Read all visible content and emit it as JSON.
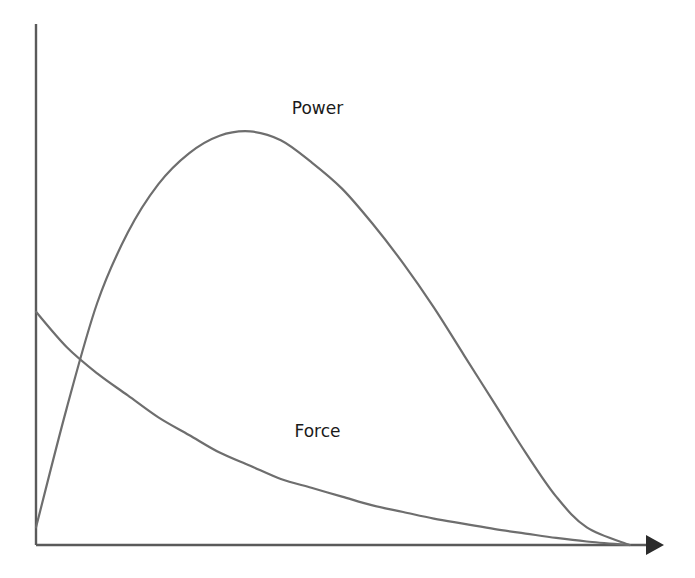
{
  "chart_data": {
    "type": "line",
    "title": "",
    "xlabel": "",
    "ylabel": "",
    "xlim": [
      0,
      1
    ],
    "ylim": [
      0,
      1
    ],
    "grid": false,
    "legend": "none",
    "x_axis_arrow": true,
    "series": [
      {
        "name": "Power",
        "label": "Power",
        "color": "#6e6e6e",
        "points": [
          [
            0.0,
            0.04
          ],
          [
            0.05,
            0.31
          ],
          [
            0.1,
            0.55
          ],
          [
            0.15,
            0.71
          ],
          [
            0.2,
            0.82
          ],
          [
            0.25,
            0.89
          ],
          [
            0.3,
            0.93
          ],
          [
            0.35,
            0.94
          ],
          [
            0.4,
            0.92
          ],
          [
            0.45,
            0.87
          ],
          [
            0.5,
            0.81
          ],
          [
            0.55,
            0.73
          ],
          [
            0.6,
            0.64
          ],
          [
            0.65,
            0.54
          ],
          [
            0.7,
            0.43
          ],
          [
            0.75,
            0.32
          ],
          [
            0.8,
            0.21
          ],
          [
            0.85,
            0.11
          ],
          [
            0.9,
            0.04
          ],
          [
            0.97,
            0.0
          ]
        ]
      },
      {
        "name": "Force",
        "label": "Force",
        "color": "#6e6e6e",
        "points": [
          [
            0.0,
            0.53
          ],
          [
            0.05,
            0.45
          ],
          [
            0.1,
            0.39
          ],
          [
            0.15,
            0.34
          ],
          [
            0.2,
            0.29
          ],
          [
            0.25,
            0.25
          ],
          [
            0.3,
            0.21
          ],
          [
            0.35,
            0.18
          ],
          [
            0.4,
            0.15
          ],
          [
            0.45,
            0.13
          ],
          [
            0.5,
            0.11
          ],
          [
            0.55,
            0.09
          ],
          [
            0.6,
            0.075
          ],
          [
            0.65,
            0.06
          ],
          [
            0.7,
            0.048
          ],
          [
            0.75,
            0.036
          ],
          [
            0.8,
            0.026
          ],
          [
            0.85,
            0.016
          ],
          [
            0.9,
            0.008
          ],
          [
            0.97,
            0.0
          ]
        ]
      }
    ],
    "annotations": [
      {
        "text": "Power",
        "series": "Power",
        "at": [
          0.46,
          0.98
        ]
      },
      {
        "text": "Force",
        "series": "Force",
        "at": [
          0.46,
          0.245
        ]
      }
    ]
  }
}
